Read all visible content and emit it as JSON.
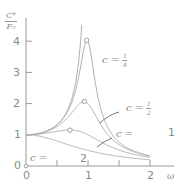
{
  "chart_data": {
    "type": "line",
    "title": "",
    "xlabel": "ω",
    "ylabel": "C*/F0",
    "ylabel_num": "C*",
    "ylabel_den": "F0",
    "xlim": [
      0,
      2.2
    ],
    "ylim": [
      0,
      4.5
    ],
    "grid": false,
    "x_ticks": [
      "0",
      "1",
      "2"
    ],
    "x_minor_ticks": [
      0.5,
      1.5
    ],
    "y_ticks": [
      "0",
      "1",
      "2",
      "3",
      "4"
    ],
    "model": "C*/F0 = 1 / sqrt((1 - ω²)² + c²ω²)",
    "series": [
      {
        "name": "c = 1/4",
        "c": 0.25,
        "peak": {
          "x": 0.98,
          "y": 4.03
        },
        "x": [
          0,
          0.25,
          0.5,
          0.7,
          0.85,
          0.95,
          0.98,
          1.05,
          1.2,
          1.5,
          2.0
        ],
        "y": [
          1.0,
          1.07,
          1.32,
          1.9,
          3.0,
          3.9,
          4.03,
          3.5,
          1.9,
          0.78,
          0.33
        ]
      },
      {
        "name": "c = 1/2",
        "c": 0.5,
        "peak": {
          "x": 0.94,
          "y": 2.07
        },
        "x": [
          0,
          0.25,
          0.5,
          0.7,
          0.85,
          0.94,
          1.05,
          1.2,
          1.5,
          2.0
        ],
        "y": [
          1.0,
          1.06,
          1.26,
          1.64,
          1.97,
          2.07,
          1.9,
          1.37,
          0.72,
          0.32
        ]
      },
      {
        "name": "c = 1",
        "c": 1.0,
        "peak": {
          "x": 0.71,
          "y": 1.15
        },
        "x": [
          0,
          0.25,
          0.5,
          0.71,
          0.9,
          1.0,
          1.2,
          1.5,
          2.0
        ],
        "y": [
          1.0,
          1.03,
          1.11,
          1.15,
          1.08,
          1.0,
          0.8,
          0.55,
          0.28
        ]
      },
      {
        "name": "c = 2",
        "c": 2.0,
        "x": [
          0,
          0.25,
          0.5,
          0.75,
          1.0,
          1.25,
          1.5,
          2.0
        ],
        "y": [
          1.0,
          0.94,
          0.8,
          0.64,
          0.5,
          0.39,
          0.31,
          0.2
        ]
      },
      {
        "name": "c = 1/8 (upper, unlabeled)",
        "c": 0.125,
        "x": [
          0,
          0.5,
          0.75,
          0.85,
          0.9
        ],
        "y": [
          1.0,
          1.33,
          2.27,
          3.6,
          4.5
        ]
      }
    ],
    "annotations": [
      {
        "text": "c = 1/4",
        "x": 1.15,
        "y": 3.6
      },
      {
        "text": "c = 1/2",
        "x": 1.55,
        "y": 1.95,
        "arrow_to": {
          "x": 1.12,
          "y": 1.6
        }
      },
      {
        "text": "c = 1",
        "x": 1.45,
        "y": 1.15,
        "arrow_to": {
          "x": 1.05,
          "y": 0.95
        }
      },
      {
        "text": "c = 2",
        "x": 0.05,
        "y": 0.38
      }
    ]
  },
  "labels": {
    "ylabel_num": "C*",
    "ylabel_den": "F₀",
    "xlabel": "ω",
    "origin": "0",
    "c_eq": "c =",
    "c14_num": "1",
    "c14_den": "4",
    "c12_num": "1",
    "c12_den": "2",
    "c1_value": "1",
    "c2_value": "2",
    "y_ticks": [
      "0",
      "1",
      "2",
      "3",
      "4"
    ],
    "x_ticks": [
      "0",
      "1",
      "2"
    ]
  }
}
